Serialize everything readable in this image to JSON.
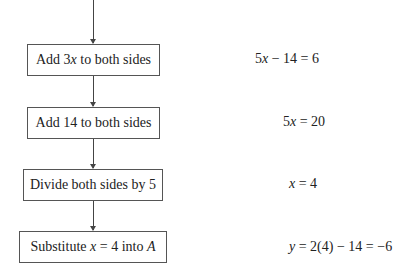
{
  "flowchart": {
    "steps": [
      {
        "pre": "Add 3",
        "var": "x",
        "post": " to both sides"
      },
      {
        "label": "Add 14 to both sides"
      },
      {
        "label": "Divide both sides by 5"
      },
      {
        "pre": "Substitute ",
        "var": "x",
        "mid": " = 4 into ",
        "var2": "A"
      }
    ],
    "results": [
      {
        "a": "5",
        "var": "x",
        "b": " − 14 = 6"
      },
      {
        "a": "5",
        "var": "x",
        "b": " = 20"
      },
      {
        "a": "",
        "var": "x",
        "b": " = 4"
      },
      {
        "a": "",
        "var": "y",
        "b": " = 2(4) − 14 = −6"
      }
    ]
  }
}
